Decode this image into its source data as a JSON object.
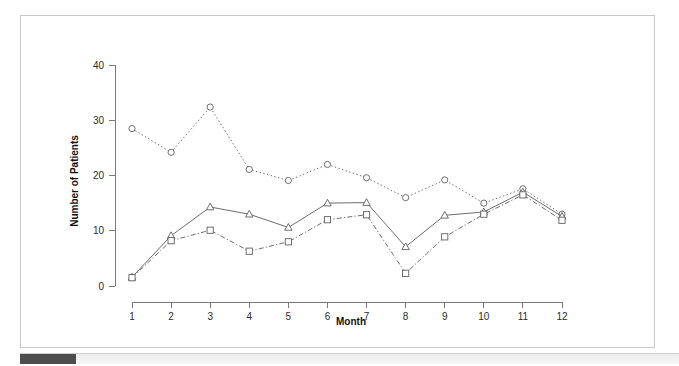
{
  "chart_data": {
    "type": "line",
    "title": "",
    "xlabel": "Month",
    "ylabel": "Number of Patients",
    "categories": [
      "1",
      "2",
      "3",
      "4",
      "5",
      "6",
      "7",
      "8",
      "9",
      "10",
      "11",
      "12"
    ],
    "x": [
      1,
      2,
      3,
      4,
      5,
      6,
      7,
      8,
      9,
      10,
      11,
      12
    ],
    "xlim": [
      0.6,
      12.4
    ],
    "ylim": [
      0,
      42
    ],
    "xticks": [
      "1",
      "2",
      "3",
      "4",
      "5",
      "6",
      "7",
      "8",
      "9",
      "10",
      "11",
      "12"
    ],
    "yticks": [
      "0",
      "10",
      "20",
      "30",
      "40"
    ],
    "ytick_values": [
      0,
      10,
      20,
      30,
      40
    ],
    "grid": false,
    "legend": "none",
    "series": [
      {
        "name": "circle-series",
        "marker": "circle",
        "linestyle": "dotted",
        "color": "#6e6e6e",
        "values": [
          28.5,
          24.2,
          32.4,
          21.1,
          19.1,
          22.0,
          19.6,
          16.0,
          19.2,
          15.0,
          17.6,
          13.0
        ]
      },
      {
        "name": "triangle-series",
        "marker": "triangle",
        "linestyle": "solid",
        "color": "#6e6e6e",
        "values": [
          1.6,
          9.1,
          14.3,
          13.0,
          10.6,
          15.0,
          15.1,
          7.1,
          12.8,
          13.4,
          17.0,
          12.6
        ]
      },
      {
        "name": "square-series",
        "marker": "square",
        "linestyle": "dashdot",
        "color": "#6e6e6e",
        "values": [
          1.5,
          8.2,
          10.1,
          6.3,
          8.0,
          12.0,
          12.9,
          2.3,
          8.9,
          13.0,
          16.5,
          11.9
        ]
      }
    ]
  },
  "axes": {
    "x_title": "Month",
    "y_title": "Number of Patients"
  },
  "scrollbar": {
    "orientation": "horizontal",
    "thumb_position": "left"
  }
}
